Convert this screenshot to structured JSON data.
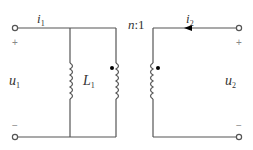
{
  "diagram": {
    "type": "ideal transformer circuit with shunt inductor",
    "colors": {
      "wire": "#555555",
      "text": "#333333",
      "sign": "#888888",
      "dot": "#000000"
    },
    "labels": {
      "i1": {
        "main": "i",
        "sub": "1"
      },
      "i2": {
        "main": "i",
        "sub": "2"
      },
      "u1": {
        "main": "u",
        "sub": "1"
      },
      "u2": {
        "main": "u",
        "sub": "2"
      },
      "L1": {
        "main": "L",
        "sub": "1"
      },
      "ratio": {
        "n": "n",
        "rest": ":1"
      }
    },
    "signs": {
      "left_plus": "+",
      "left_minus": "−",
      "right_plus": "+",
      "right_minus": "−"
    }
  }
}
